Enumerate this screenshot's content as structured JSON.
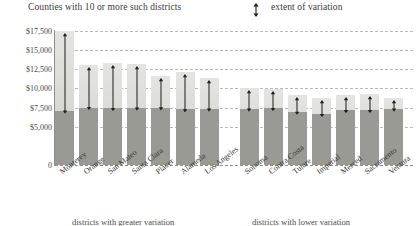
{
  "header": {
    "title": "Counties with 10 or more such districts",
    "legend_label": "extent of variation",
    "legend_icon": "double-headed-arrow-icon"
  },
  "footnotes": {
    "left": "districts with greater variation",
    "right": "districts with lower variation"
  },
  "chart_data": {
    "type": "bar",
    "title": "Counties with 10 or more such districts",
    "xlabel": "",
    "ylabel": "",
    "ylim": [
      0,
      17500
    ],
    "grid": true,
    "legend": [
      "extent of variation"
    ],
    "legend_position": "top-right",
    "ytick_labels": [
      "$17,500",
      "$15,000",
      "$12,500",
      "$10,000",
      "$7,500",
      "$5,000",
      "0"
    ],
    "ytick_values": [
      17500,
      15000,
      12500,
      10000,
      7500,
      5000,
      0
    ],
    "categories": [
      "Monterey",
      "Orange",
      "San Mateo",
      "Santa Clara",
      "Placer",
      "Alameda",
      "Los Angeles",
      "Sonoma",
      "Contra Costa",
      "Tulare",
      "Imperial",
      "Merced",
      "Sacramento",
      "Ventura"
    ],
    "groups": [
      {
        "name": "districts with greater variation",
        "categories": [
          "Monterey",
          "Orange",
          "San Mateo",
          "Santa Clara",
          "Placer",
          "Alameda",
          "Los Angeles"
        ]
      },
      {
        "name": "districts with lower variation",
        "categories": [
          "Sonoma",
          "Contra Costa",
          "Tulare",
          "Imperial",
          "Merced",
          "Sacramento",
          "Ventura"
        ]
      }
    ],
    "series": [
      {
        "name": "high (top of bar)",
        "values": [
          17500,
          13000,
          13300,
          13200,
          11600,
          12200,
          11300,
          10000,
          9900,
          9100,
          8800,
          9200,
          9300,
          8700
        ]
      },
      {
        "name": "low (dark segment top)",
        "values": [
          7100,
          7500,
          7400,
          7500,
          7500,
          7300,
          7300,
          7300,
          7400,
          6900,
          6700,
          7200,
          7200,
          7300
        ]
      }
    ],
    "bars": [
      {
        "label": "Monterey",
        "high": 17500,
        "low": 7100,
        "group": 0
      },
      {
        "label": "Orange",
        "high": 13000,
        "low": 7500,
        "group": 0
      },
      {
        "label": "San Mateo",
        "high": 13300,
        "low": 7400,
        "group": 0
      },
      {
        "label": "Santa Clara",
        "high": 13200,
        "low": 7500,
        "group": 0
      },
      {
        "label": "Placer",
        "high": 11600,
        "low": 7500,
        "group": 0
      },
      {
        "label": "Alameda",
        "high": 12200,
        "low": 7300,
        "group": 0
      },
      {
        "label": "Los Angeles",
        "high": 11300,
        "low": 7300,
        "group": 0
      },
      {
        "label": "Sonoma",
        "high": 10000,
        "low": 7300,
        "group": 1
      },
      {
        "label": "Contra Costa",
        "high": 9900,
        "low": 7400,
        "group": 1
      },
      {
        "label": "Tulare",
        "high": 9100,
        "low": 6900,
        "group": 1
      },
      {
        "label": "Imperial",
        "high": 8800,
        "low": 6700,
        "group": 1
      },
      {
        "label": "Merced",
        "high": 9200,
        "low": 7200,
        "group": 1
      },
      {
        "label": "Sacramento",
        "high": 9300,
        "low": 7200,
        "group": 1
      },
      {
        "label": "Ventura",
        "high": 8700,
        "low": 7300,
        "group": 1
      }
    ],
    "colors": {
      "bar_low": "#9a9a95",
      "bar_high": "#d8d8d4",
      "gridline": "#b9b9b4",
      "arrow": "#1d1d1b",
      "text": "#35352f"
    }
  }
}
